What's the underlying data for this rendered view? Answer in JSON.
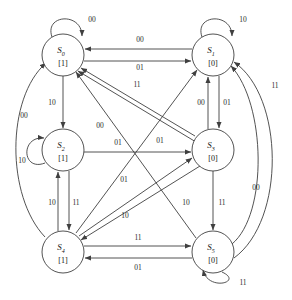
{
  "diagram": {
    "type": "finite-state-machine",
    "title": "",
    "state_label_format": "S_index with output in brackets",
    "input_alphabet": [
      "00",
      "01",
      "10",
      "11"
    ],
    "states": [
      {
        "id": "S0",
        "name": "S",
        "subscript": "0",
        "output": "[1]",
        "cx": 63,
        "cy": 55,
        "r": 21
      },
      {
        "id": "S1",
        "name": "S",
        "subscript": "1",
        "output": "[0]",
        "cx": 213,
        "cy": 55,
        "r": 21
      },
      {
        "id": "S2",
        "name": "S",
        "subscript": "2",
        "output": "[1]",
        "cx": 63,
        "cy": 150,
        "r": 21
      },
      {
        "id": "S3",
        "name": "S",
        "subscript": "3",
        "output": "[0]",
        "cx": 213,
        "cy": 150,
        "r": 21
      },
      {
        "id": "S4",
        "name": "S",
        "subscript": "4",
        "output": "[1]",
        "cx": 63,
        "cy": 252,
        "r": 21
      },
      {
        "id": "S5",
        "name": "S",
        "subscript": "5",
        "output": "[0]",
        "cx": 213,
        "cy": 252,
        "r": 21
      }
    ],
    "transitions": [
      {
        "from": "S0",
        "to": "S0",
        "input": "00",
        "kind": "self-loop-top",
        "label_x": 92,
        "label_y": 22
      },
      {
        "from": "S1",
        "to": "S1",
        "input": "10",
        "kind": "self-loop-top",
        "label_x": 243,
        "label_y": 22
      },
      {
        "from": "S2",
        "to": "S2",
        "input": "10",
        "kind": "self-loop-left",
        "label_x": 22,
        "label_y": 163
      },
      {
        "from": "S5",
        "to": "S5",
        "input": "11",
        "kind": "self-loop-bottom",
        "label_x": 243,
        "label_y": 285
      },
      {
        "from": "S1",
        "to": "S0",
        "input": "00",
        "kind": "straight",
        "label_x": 140,
        "label_y": 42
      },
      {
        "from": "S0",
        "to": "S1",
        "input": "01",
        "kind": "straight",
        "label_x": 140,
        "label_y": 70
      },
      {
        "from": "S4",
        "to": "S5",
        "input": "11",
        "kind": "straight",
        "label_x": 138,
        "label_y": 240
      },
      {
        "from": "S5",
        "to": "S4",
        "input": "01",
        "kind": "straight",
        "label_x": 138,
        "label_y": 270
      },
      {
        "from": "S0",
        "to": "S2",
        "input": "10",
        "kind": "straight",
        "label_x": 52,
        "label_y": 105
      },
      {
        "from": "S3",
        "to": "S1",
        "input": "00",
        "kind": "straight",
        "label_x": 201,
        "label_y": 105
      },
      {
        "from": "S1",
        "to": "S3",
        "input": "01",
        "kind": "straight",
        "label_x": 227,
        "label_y": 105
      },
      {
        "from": "S4",
        "to": "S2",
        "input": "10",
        "kind": "straight",
        "label_x": 52,
        "label_y": 205
      },
      {
        "from": "S2",
        "to": "S4",
        "input": "11",
        "kind": "straight",
        "label_x": 76,
        "label_y": 205
      },
      {
        "from": "S3",
        "to": "S5",
        "input": "11",
        "kind": "straight",
        "label_x": 222,
        "label_y": 205
      },
      {
        "from": "S2",
        "to": "S3",
        "input": "01",
        "kind": "straight",
        "label_x": 118,
        "label_y": 145
      },
      {
        "from": "S2",
        "to": "S0",
        "input": "00",
        "kind": "diagonal",
        "label_x": 100,
        "label_y": 128
      },
      {
        "from": "S3",
        "to": "S0",
        "input": "11",
        "kind": "diagonal",
        "label_x": 137,
        "label_y": 87
      },
      {
        "from": "S4",
        "to": "S1",
        "input": "01",
        "kind": "diagonal",
        "label_x": 124,
        "label_y": 182
      },
      {
        "from": "S4",
        "to": "S3",
        "input": "01",
        "kind": "diagonal",
        "label_x": 160,
        "label_y": 143
      },
      {
        "from": "S5",
        "to": "S0",
        "input": "10",
        "kind": "diagonal",
        "label_x": 125,
        "label_y": 218
      },
      {
        "from": "S3",
        "to": "S4",
        "input": "10",
        "kind": "diagonal",
        "label_x": 186,
        "label_y": 205
      },
      {
        "from": "S4",
        "to": "S0",
        "input": "00",
        "kind": "arc-left",
        "label_x": 24,
        "label_y": 118
      },
      {
        "from": "S5",
        "to": "S1",
        "input": "00",
        "kind": "arc-right-inner",
        "label_x": 256,
        "label_y": 190
      },
      {
        "from": "S5",
        "to": "S1",
        "input": "11",
        "kind": "arc-right-outer",
        "label_x": 275,
        "label_y": 88
      }
    ]
  }
}
